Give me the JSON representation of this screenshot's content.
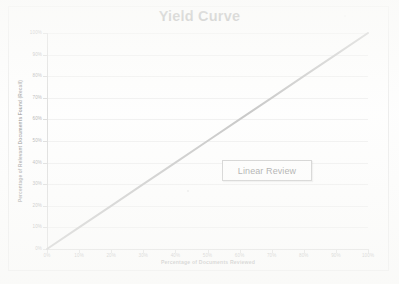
{
  "document": {
    "kind": "scanned-chart-page",
    "frame_color": "#d9d9d9",
    "background_color": "#ffffff"
  },
  "chart_data": {
    "type": "line",
    "title": "Yield Curve",
    "xlabel": "Percentage of Documents Reviewed",
    "ylabel": "Percentage of Relevant Documents Found (Recall)",
    "xlim": [
      0,
      100
    ],
    "ylim": [
      0,
      100
    ],
    "grid": true,
    "legend": null,
    "x_ticks": [
      "0%",
      "10%",
      "20%",
      "30%",
      "40%",
      "50%",
      "60%",
      "70%",
      "80%",
      "90%",
      "100%"
    ],
    "y_ticks": [
      "0%",
      "10%",
      "20%",
      "30%",
      "40%",
      "50%",
      "60%",
      "70%",
      "80%",
      "90%",
      "100%"
    ],
    "series": [
      {
        "name": "Linear Review",
        "color": "#8a8a8a",
        "line_width": 2,
        "x": [
          0,
          10,
          20,
          30,
          40,
          50,
          60,
          70,
          80,
          90,
          100
        ],
        "values": [
          0,
          10,
          20,
          30,
          40,
          50,
          60,
          70,
          80,
          90,
          100
        ]
      }
    ],
    "annotations": [
      {
        "label": "Linear Review",
        "kind": "boxed-callout",
        "x_percent": 55,
        "y_percent": 41
      }
    ]
  },
  "annotation": {
    "linear_review_label": "Linear Review"
  }
}
